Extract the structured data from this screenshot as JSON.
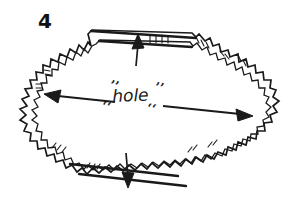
{
  "figure": {
    "number_label": "4",
    "caption_note": "",
    "background_color": "#ffffff",
    "ink_color": "#1a1a1a",
    "width": 295,
    "height": 207
  },
  "annotations": {
    "hole_label": "hole",
    "quote_open_upper": "’’",
    "quote_open_lower": "‘‘",
    "quote_close_upper": "’’",
    "quote_close_lower": "‘‘"
  },
  "dimensions": {
    "horizontal": {
      "name": "width-dimension-arrow",
      "label": "hole",
      "style": "double-headed-arrow",
      "start_x": 44,
      "start_y": 94,
      "end_x": 252,
      "end_y": 114
    },
    "vertical_top": {
      "name": "top-dimension-arrow",
      "style": "single-headed-arrow-up",
      "x": 137,
      "from_y": 66,
      "to_y": 36
    },
    "vertical_bottom": {
      "name": "bottom-dimension-arrow",
      "style": "single-headed-arrow-down",
      "x": 128,
      "from_y": 155,
      "to_y": 188
    }
  },
  "shape": {
    "name": "jagged-hole-outline",
    "description": "irregular torn hole outline with zigzag double line edges",
    "top_edge_style": "straight-double-line",
    "bottom_edge_style": "straight-double-line",
    "left_edge_style": "jagged-zigzag",
    "right_edge_style": "jagged-stepped"
  }
}
